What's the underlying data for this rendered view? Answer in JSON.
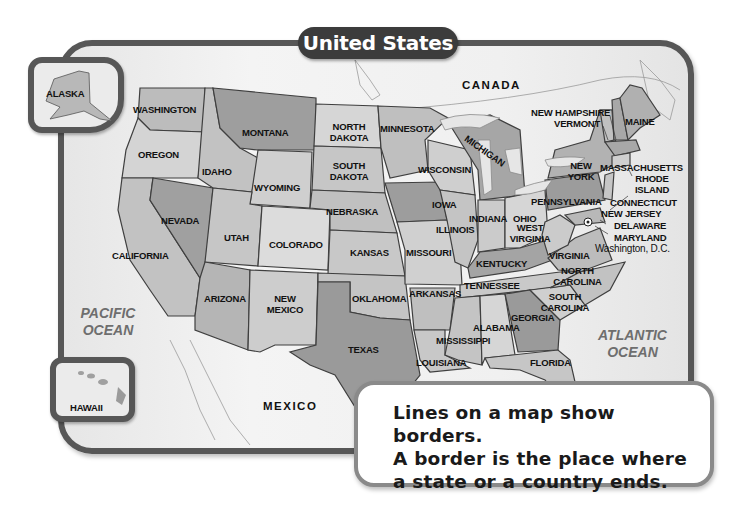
{
  "title": "United States",
  "colors": {
    "frame": "#575757",
    "title_bg": "#3c3c3c",
    "ocean_text": "#6e6e6e",
    "state_light": "#d4d4d4",
    "state_mid": "#b8b8b8",
    "state_dark": "#959595",
    "water": "#e8e8e8"
  },
  "countries": {
    "canada": "CANADA",
    "mexico": "MEXICO"
  },
  "oceans": {
    "pacific": "PACIFIC OCEAN",
    "atlantic": "ATLANTIC OCEAN"
  },
  "insets": {
    "alaska": "ALASKA",
    "hawaii": "HAWAII"
  },
  "states": {
    "washington": "WASHINGTON",
    "oregon": "OREGON",
    "california": "CALIFORNIA",
    "idaho": "IDAHO",
    "nevada": "NEVADA",
    "montana": "MONTANA",
    "wyoming": "WYOMING",
    "utah": "UTAH",
    "arizona": "ARIZONA",
    "colorado": "COLORADO",
    "new_mexico": "NEW MEXICO",
    "north_dakota": "NORTH DAKOTA",
    "south_dakota": "SOUTH DAKOTA",
    "nebraska": "NEBRASKA",
    "kansas": "KANSAS",
    "oklahoma": "OKLAHOMA",
    "texas": "TEXAS",
    "minnesota": "MINNESOTA",
    "iowa": "IOWA",
    "missouri": "MISSOURI",
    "arkansas": "ARKANSAS",
    "louisiana": "LOUISIANA",
    "wisconsin": "WISCONSIN",
    "michigan": "MICHIGAN",
    "illinois": "ILLINOIS",
    "indiana": "INDIANA",
    "ohio": "OHIO",
    "kentucky": "KENTUCKY",
    "tennessee": "TENNESSEE",
    "mississippi": "MISSISSIPPI",
    "alabama": "ALABAMA",
    "georgia": "GEORGIA",
    "florida": "FLORIDA",
    "south_carolina": "SOUTH CAROLINA",
    "north_carolina": "NORTH CAROLINA",
    "virginia": "VIRGINIA",
    "west_virginia": "WEST VIRGINIA",
    "pennsylvania": "PENNSYLVANIA",
    "new_york": "NEW YORK",
    "maine": "MAINE",
    "new_hampshire": "NEW HAMPSHIRE",
    "vermont": "VERMONT",
    "massachusetts": "MASSACHUSETTS",
    "rhode_island": "RHODE ISLAND",
    "connecticut": "CONNECTICUT",
    "new_jersey": "NEW JERSEY",
    "delaware": "DELAWARE",
    "maryland": "MARYLAND",
    "dc": "Washington, D.C."
  },
  "callout": {
    "line1": "Lines on a map show borders.",
    "line2": "A border is the place where",
    "line3": "a state or a country ends."
  }
}
